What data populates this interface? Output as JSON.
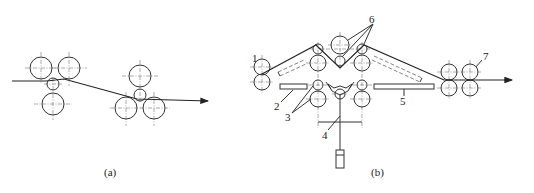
{
  "figure": {
    "subfigures": [
      {
        "id": "a",
        "caption": "(a)",
        "description": "Strip passing through two three-roll groups (offset roll arrangement)"
      },
      {
        "id": "b",
        "caption": "(b)",
        "description": "Roll forming / leveling line with numbered components",
        "callouts": [
          {
            "number": "1",
            "target": "entry roll pair"
          },
          {
            "number": "2",
            "target": "left guide plate"
          },
          {
            "number": "3",
            "target": "lower work rolls"
          },
          {
            "number": "4",
            "target": "lifting frame / actuator linkage"
          },
          {
            "number": "5",
            "target": "right guide plate"
          },
          {
            "number": "6",
            "target": "upper bending rolls"
          },
          {
            "number": "7",
            "target": "exit pinch roll set"
          }
        ]
      }
    ]
  },
  "colors": {
    "line": "#333333",
    "background": "#ffffff"
  }
}
